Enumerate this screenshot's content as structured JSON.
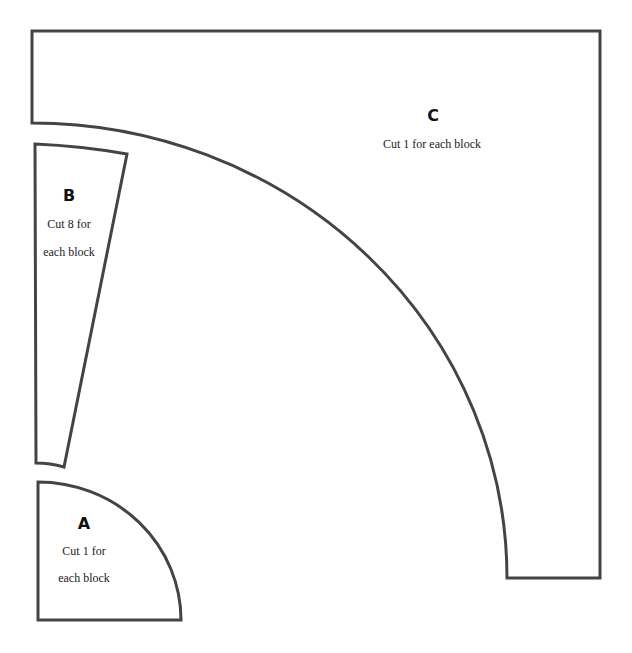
{
  "pieces": {
    "a": {
      "letter": "A",
      "line1": "Cut 1 for",
      "line2": "each block"
    },
    "b": {
      "letter": "B",
      "line1": "Cut 8 for",
      "line2": "each block"
    },
    "c": {
      "letter": "C",
      "line1": "Cut 1 for each block"
    }
  },
  "colors": {
    "stroke": "#444444",
    "background": "#ffffff"
  }
}
